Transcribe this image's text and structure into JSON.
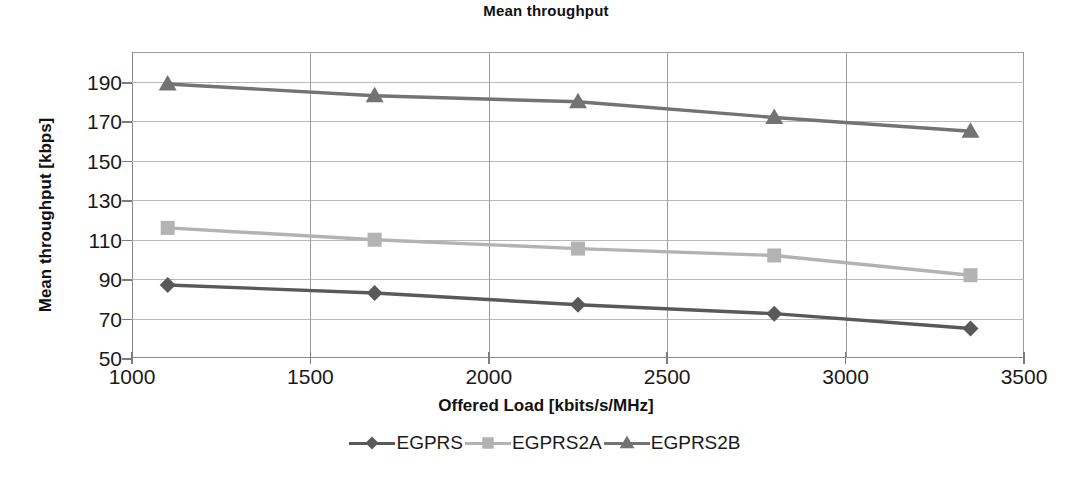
{
  "chart_data": {
    "type": "line",
    "title": "Mean throughput",
    "xlabel": "Offered Load [kbits/s/MHz]",
    "ylabel": "Mean throughput [kbps]",
    "x": [
      1100,
      1680,
      2250,
      2800,
      3350
    ],
    "xlim": [
      1000,
      3500
    ],
    "ylim": [
      50,
      190
    ],
    "xticks": [
      1000,
      1500,
      2000,
      2500,
      3000,
      3500
    ],
    "yticks": [
      50,
      70,
      90,
      110,
      130,
      150,
      170,
      190
    ],
    "xtick_labels": [
      "1000",
      "1500",
      "2000",
      "2500",
      "3000",
      "3500"
    ],
    "ytick_labels": [
      "50",
      "70",
      "90",
      "110",
      "130",
      "150",
      "170",
      "190"
    ],
    "grid": "horizontal-and-vertical",
    "legend_position": "bottom",
    "series": [
      {
        "name": "EGPRS",
        "marker": "diamond",
        "color": "#595959",
        "values": [
          87,
          83,
          77,
          72.5,
          65
        ]
      },
      {
        "name": "EGPRS2A",
        "marker": "square",
        "color": "#b3b3b3",
        "values": [
          116,
          110,
          105.5,
          102,
          92
        ]
      },
      {
        "name": "EGPRS2B",
        "marker": "triangle",
        "color": "#737373",
        "values": [
          189,
          183,
          180,
          172,
          165
        ]
      }
    ]
  },
  "legend": {
    "items": [
      {
        "label": "EGPRS"
      },
      {
        "label": "EGPRS2A"
      },
      {
        "label": "EGPRS2B"
      }
    ]
  }
}
